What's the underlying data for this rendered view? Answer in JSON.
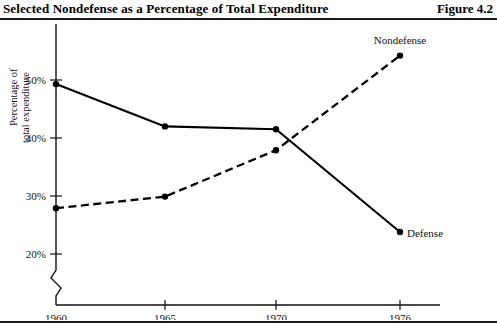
{
  "header": {
    "title": "Selected Nondefense as a Percentage of Total Expenditure",
    "figure_label": "Figure 4.2"
  },
  "axes": {
    "ylabel_line1": "Percentage of",
    "ylabel_line2": "total expenditure",
    "ytick_labels": [
      "50%",
      "40%",
      "30%",
      "20%"
    ],
    "xtick_labels": [
      "1960",
      "1965",
      "1970",
      "1976"
    ]
  },
  "series_labels": {
    "nondefense": "Nondefense",
    "defense": "Defense"
  },
  "chart_data": {
    "type": "line",
    "title": "Selected Nondefense as a Percentage of Total Expenditure",
    "xlabel": "",
    "ylabel": "Percentage of total expenditure",
    "x": [
      1960,
      1965,
      1970,
      1976
    ],
    "xtick_labels": [
      "1960",
      "1965",
      "1970",
      "1976"
    ],
    "ytick_values": [
      20,
      30,
      40,
      50
    ],
    "ytick_labels": [
      "20%",
      "30%",
      "40%",
      "50%"
    ],
    "ylim": [
      15,
      57
    ],
    "xlim": [
      1959,
      1978
    ],
    "y_axis_break": true,
    "grid": false,
    "legend": "inline-labels",
    "series": [
      {
        "name": "Defense",
        "style": "solid",
        "marker": "dot",
        "label_position": "right-of-last-point",
        "values": [
          49.3,
          42.0,
          41.5,
          23.8
        ]
      },
      {
        "name": "Nondefense",
        "style": "dashed",
        "marker": "dot",
        "label_position": "above-last-point",
        "values": [
          27.9,
          29.9,
          37.9,
          54.2
        ]
      }
    ]
  },
  "colors": {
    "line": "#000000",
    "rule": "#1a1a1a",
    "background": "#ffffff"
  }
}
